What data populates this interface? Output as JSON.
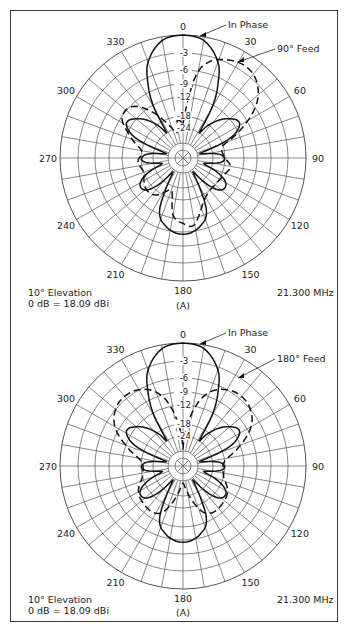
{
  "chart_data": [
    {
      "type": "polar",
      "panel_label": "(A)",
      "title": "Azimuth pattern, 10° elevation",
      "annotations": {
        "elevation": "10° Elevation",
        "reference": "0 dB = 18.09 dBi",
        "frequency": "21.300 MHz"
      },
      "angle_ticks": [
        "0",
        "30",
        "60",
        "90",
        "120",
        "150",
        "180",
        "210",
        "240",
        "270",
        "300",
        "330"
      ],
      "radial_ticks_db": [
        "0",
        "3",
        "6",
        "9",
        "12",
        "18",
        "24"
      ],
      "radial_tick_labels": [
        "",
        "-3",
        "-6",
        "-9",
        "-12",
        "-18",
        "-24"
      ],
      "rlim_db": [
        -30,
        0
      ],
      "grid": true,
      "series": [
        {
          "name": "In Phase",
          "style": "solid",
          "points_deg_db": [
            [
              0,
              0
            ],
            [
              10,
              -0.6
            ],
            [
              20,
              -3.5
            ],
            [
              25,
              -7
            ],
            [
              30,
              -13
            ],
            [
              33,
              -24
            ],
            [
              38,
              -18
            ],
            [
              50,
              -12
            ],
            [
              60,
              -11
            ],
            [
              68,
              -16
            ],
            [
              75,
              -30
            ],
            [
              85,
              -20
            ],
            [
              95,
              -19
            ],
            [
              105,
              -28
            ],
            [
              115,
              -18
            ],
            [
              125,
              -15
            ],
            [
              135,
              -18
            ],
            [
              145,
              -30
            ],
            [
              155,
              -14
            ],
            [
              165,
              -10
            ],
            [
              180,
              -8.5
            ],
            [
              195,
              -10
            ],
            [
              205,
              -14
            ],
            [
              215,
              -30
            ],
            [
              225,
              -18
            ],
            [
              235,
              -15
            ],
            [
              245,
              -18
            ],
            [
              255,
              -28
            ],
            [
              265,
              -19
            ],
            [
              275,
              -20
            ],
            [
              285,
              -30
            ],
            [
              292,
              -16
            ],
            [
              300,
              -11
            ],
            [
              310,
              -12
            ],
            [
              322,
              -18
            ],
            [
              327,
              -24
            ],
            [
              330,
              -13
            ],
            [
              335,
              -7
            ],
            [
              340,
              -3.5
            ],
            [
              350,
              -0.6
            ],
            [
              360,
              0
            ]
          ]
        },
        {
          "name": "90° Feed",
          "style": "dashed",
          "points_deg_db": [
            [
              0,
              -22
            ],
            [
              8,
              -8
            ],
            [
              15,
              -4
            ],
            [
              25,
              -2.5
            ],
            [
              35,
              -2
            ],
            [
              45,
              -3
            ],
            [
              55,
              -6
            ],
            [
              65,
              -12
            ],
            [
              75,
              -19
            ],
            [
              90,
              -18
            ],
            [
              100,
              -16
            ],
            [
              110,
              -17
            ],
            [
              125,
              -18
            ],
            [
              140,
              -18
            ],
            [
              155,
              -16
            ],
            [
              170,
              -10.5
            ],
            [
              180,
              -11
            ],
            [
              190,
              -13
            ],
            [
              200,
              -22
            ],
            [
              215,
              -17
            ],
            [
              230,
              -16
            ],
            [
              250,
              -18
            ],
            [
              265,
              -17
            ],
            [
              280,
              -18
            ],
            [
              295,
              -12
            ],
            [
              305,
              -9
            ],
            [
              318,
              -10
            ],
            [
              330,
              -16
            ],
            [
              345,
              -26
            ],
            [
              352,
              -20
            ],
            [
              360,
              -22
            ]
          ]
        }
      ]
    },
    {
      "type": "polar",
      "panel_label": "(A)",
      "title": "Azimuth pattern, 10° elevation",
      "annotations": {
        "elevation": "10° Elevation",
        "reference": "0 dB = 18.09 dBi",
        "frequency": "21.300 MHz"
      },
      "angle_ticks": [
        "0",
        "30",
        "60",
        "90",
        "120",
        "150",
        "180",
        "210",
        "240",
        "270",
        "300",
        "330"
      ],
      "radial_ticks_db": [
        "0",
        "3",
        "6",
        "9",
        "12",
        "18",
        "24"
      ],
      "radial_tick_labels": [
        "",
        "-3",
        "-6",
        "-9",
        "-12",
        "-18",
        "-24"
      ],
      "rlim_db": [
        -30,
        0
      ],
      "grid": true,
      "series": [
        {
          "name": "In Phase",
          "style": "solid",
          "points_deg_db": [
            [
              0,
              0
            ],
            [
              10,
              -0.6
            ],
            [
              20,
              -3.5
            ],
            [
              25,
              -7
            ],
            [
              30,
              -13
            ],
            [
              33,
              -24
            ],
            [
              38,
              -18
            ],
            [
              50,
              -12
            ],
            [
              60,
              -11
            ],
            [
              68,
              -16
            ],
            [
              75,
              -30
            ],
            [
              85,
              -20
            ],
            [
              95,
              -19
            ],
            [
              105,
              -28
            ],
            [
              115,
              -18
            ],
            [
              125,
              -15
            ],
            [
              135,
              -18
            ],
            [
              145,
              -30
            ],
            [
              155,
              -14
            ],
            [
              165,
              -10
            ],
            [
              180,
              -8.5
            ],
            [
              195,
              -10
            ],
            [
              205,
              -14
            ],
            [
              215,
              -30
            ],
            [
              225,
              -18
            ],
            [
              235,
              -15
            ],
            [
              245,
              -18
            ],
            [
              255,
              -28
            ],
            [
              265,
              -19
            ],
            [
              275,
              -20
            ],
            [
              285,
              -30
            ],
            [
              292,
              -16
            ],
            [
              300,
              -11
            ],
            [
              310,
              -12
            ],
            [
              322,
              -18
            ],
            [
              327,
              -24
            ],
            [
              330,
              -13
            ],
            [
              335,
              -7
            ],
            [
              340,
              -3.5
            ],
            [
              350,
              -0.6
            ],
            [
              360,
              0
            ]
          ]
        },
        {
          "name": "180° Feed",
          "style": "dashed",
          "points_deg_db": [
            [
              0,
              -30
            ],
            [
              5,
              -20
            ],
            [
              12,
              -12
            ],
            [
              20,
              -8
            ],
            [
              30,
              -6
            ],
            [
              40,
              -5.5
            ],
            [
              50,
              -6
            ],
            [
              60,
              -8
            ],
            [
              70,
              -12
            ],
            [
              80,
              -17
            ],
            [
              90,
              -19
            ],
            [
              105,
              -18
            ],
            [
              120,
              -15
            ],
            [
              135,
              -14
            ],
            [
              150,
              -14
            ],
            [
              160,
              -17
            ],
            [
              170,
              -25
            ],
            [
              180,
              -30
            ],
            [
              190,
              -25
            ],
            [
              200,
              -17
            ],
            [
              210,
              -14
            ],
            [
              225,
              -14
            ],
            [
              240,
              -15
            ],
            [
              255,
              -18
            ],
            [
              270,
              -19
            ],
            [
              280,
              -17
            ],
            [
              290,
              -12
            ],
            [
              300,
              -8
            ],
            [
              310,
              -6
            ],
            [
              320,
              -5.5
            ],
            [
              330,
              -6
            ],
            [
              340,
              -8
            ],
            [
              348,
              -12
            ],
            [
              355,
              -20
            ],
            [
              360,
              -30
            ]
          ]
        }
      ]
    }
  ],
  "panels": [
    {
      "center": [
        183,
        158
      ],
      "legend": {
        "solid_label": "In Phase",
        "dashed_label": "90° Feed"
      },
      "annotations": {
        "elevation": "10° Elevation",
        "reference": "0 dB = 18.09 dBi",
        "frequency": "21.300 MHz",
        "panel_label": "(A)"
      }
    },
    {
      "center": [
        183,
        466
      ],
      "legend": {
        "solid_label": "In Phase",
        "dashed_label": "180° Feed"
      },
      "annotations": {
        "elevation": "10° Elevation",
        "reference": "0 dB = 18.09 dBi",
        "frequency": "21.300 MHz",
        "panel_label": "(A)"
      }
    }
  ]
}
